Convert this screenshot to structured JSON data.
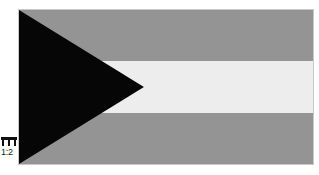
{
  "figure": {
    "ratio_label": "1:2",
    "ratio_icon": "flag-proportion-icon",
    "background_color": "#ffffff",
    "border_color": "#c9c9c9",
    "flag": {
      "width_px": 294,
      "height_px": 154,
      "stripes": [
        {
          "name": "top-stripe",
          "color": "#949494",
          "share": "1/3"
        },
        {
          "name": "middle-stripe",
          "color": "#ededed",
          "share": "1/3"
        },
        {
          "name": "bottom-stripe",
          "color": "#949494",
          "share": "1/3"
        }
      ],
      "hoist_triangle": {
        "name": "hoist-triangle",
        "color": "#060606",
        "apex_x_fraction": 0.425,
        "apex_y_fraction": 0.5
      }
    }
  }
}
